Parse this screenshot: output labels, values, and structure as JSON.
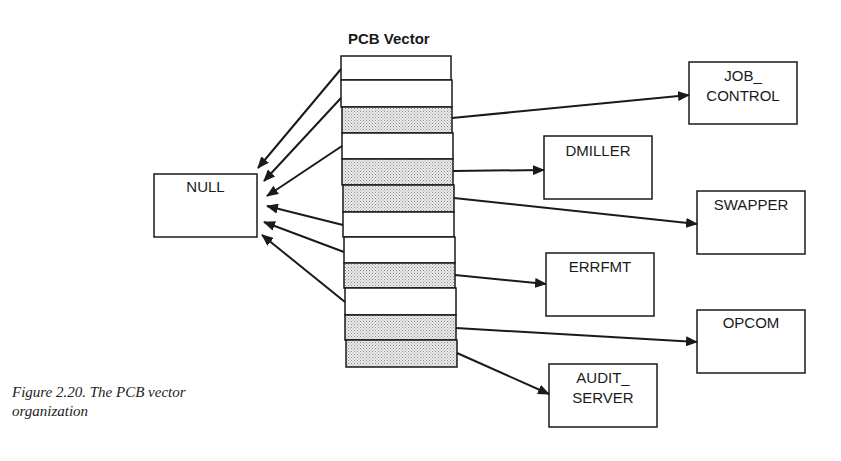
{
  "figure": {
    "title": "PCB Vector",
    "caption_line1": "Figure 2.20. The PCB vector",
    "caption_line2": "organization"
  },
  "vector": {
    "slot_count": 12,
    "slots": [
      {
        "index": 1,
        "shaded": false,
        "points_to": "NULL"
      },
      {
        "index": 2,
        "shaded": false,
        "points_to": "NULL"
      },
      {
        "index": 3,
        "shaded": true,
        "points_to": "JOB_CONTROL"
      },
      {
        "index": 4,
        "shaded": false,
        "points_to": "NULL"
      },
      {
        "index": 5,
        "shaded": true,
        "points_to": "DMILLER"
      },
      {
        "index": 6,
        "shaded": true,
        "points_to": "SWAPPER"
      },
      {
        "index": 7,
        "shaded": false,
        "points_to": "NULL"
      },
      {
        "index": 8,
        "shaded": false,
        "points_to": "NULL"
      },
      {
        "index": 9,
        "shaded": true,
        "points_to": "ERRFMT"
      },
      {
        "index": 10,
        "shaded": false,
        "points_to": "NULL"
      },
      {
        "index": 11,
        "shaded": true,
        "points_to": "OPCOM"
      },
      {
        "index": 12,
        "shaded": true,
        "points_to": "AUDIT_SERVER"
      }
    ]
  },
  "nodes": {
    "null": {
      "label": "NULL"
    },
    "job_control": {
      "line1": "JOB_",
      "line2": "CONTROL"
    },
    "dmiller": {
      "label": "DMILLER"
    },
    "swapper": {
      "label": "SWAPPER"
    },
    "errfmt": {
      "label": "ERRFMT"
    },
    "opcom": {
      "label": "OPCOM"
    },
    "audit_server": {
      "line1": "AUDIT_",
      "line2": "SERVER"
    }
  },
  "colors": {
    "line": "#1a1a1a",
    "shade": "#d8d8d8",
    "background": "#ffffff"
  }
}
